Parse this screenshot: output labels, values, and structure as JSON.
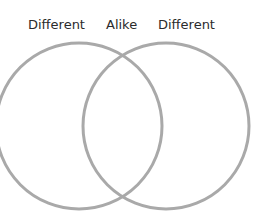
{
  "labels": {
    "left": "Different",
    "middle": "Alike",
    "right": "Different"
  },
  "diagram": {
    "type": "venn",
    "circles": [
      {
        "name": "left-circle",
        "cx": 79,
        "cy": 126,
        "r": 83
      },
      {
        "name": "right-circle",
        "cx": 166,
        "cy": 126,
        "r": 83
      }
    ],
    "stroke_color": "#a9a9a9"
  }
}
